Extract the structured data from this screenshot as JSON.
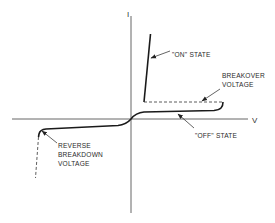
{
  "diagram": {
    "type": "thyristor I-V characteristic",
    "axes": {
      "y_label": "I",
      "x_label": "V"
    },
    "labels": {
      "on_state": "\"ON\" STATE",
      "breakover_line1": "BREAKOVER",
      "breakover_line2": "VOLTAGE",
      "off_state": "\"OFF\" STATE",
      "reverse_line1": "REVERSE",
      "reverse_line2": "BREAKDOWN",
      "reverse_line3": "VOLTAGE"
    },
    "colors": {
      "background": "#ffffff",
      "line": "#1a1a1a",
      "axis": "#555555",
      "text": "#2a2a2a"
    }
  }
}
